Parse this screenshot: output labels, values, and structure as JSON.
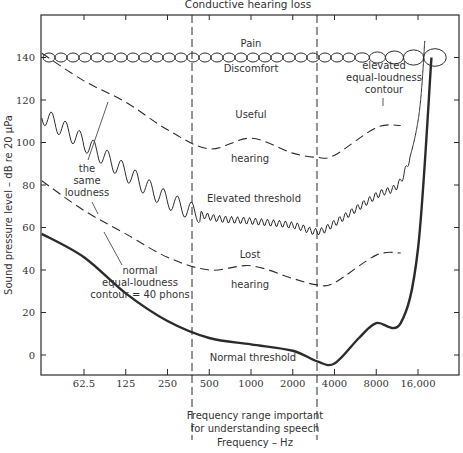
{
  "chart_data": {
    "type": "line",
    "title": "Conductive hearing loss",
    "xlabel": "Frequency – Hz",
    "ylabel": "Sound pressure level – dB re 20 μPa",
    "x_scale": "log",
    "x_ticks": [
      "62.5",
      "125",
      "250",
      "500",
      "1000",
      "2000",
      "4000",
      "8000",
      "16,000"
    ],
    "x_tick_values": [
      62.5,
      125,
      250,
      500,
      1000,
      2000,
      4000,
      8000,
      16000
    ],
    "y_ticks": [
      0,
      20,
      40,
      60,
      80,
      100,
      120,
      140
    ],
    "ylim": [
      -10,
      160
    ],
    "grid": false,
    "speech_range": {
      "x_start": 350,
      "x_end": 3000,
      "label_lines": [
        "Frequency range important",
        "for understanding speech"
      ]
    },
    "series": [
      {
        "name": "Normal threshold",
        "style": "solid-thick",
        "x": [
          31,
          62.5,
          125,
          250,
          500,
          1000,
          2000,
          3000,
          4000,
          6000,
          8000,
          12000,
          16000,
          20000
        ],
        "y": [
          57,
          46,
          29,
          16,
          8,
          5,
          2,
          -3,
          -4,
          8,
          15,
          15,
          50,
          140
        ]
      },
      {
        "name": "Elevated threshold",
        "style": "zigzag",
        "x": [
          31,
          62.5,
          125,
          250,
          500,
          1000,
          2000,
          3000,
          4000,
          8000,
          12000,
          16000,
          18000
        ],
        "y": [
          113,
          100,
          86,
          73,
          65,
          63,
          61,
          58,
          62,
          75,
          82,
          110,
          150
        ]
      },
      {
        "name": "normal equal-loudness contour = 40 phons",
        "style": "dashed",
        "x": [
          31,
          62.5,
          125,
          250,
          500,
          1000,
          2000,
          3000,
          4000,
          8000,
          12000
        ],
        "y": [
          82,
          68,
          57,
          46,
          40,
          42,
          36,
          33,
          34,
          47,
          48
        ]
      },
      {
        "name": "elevated equal-loudness contour",
        "style": "dashed",
        "x": [
          31,
          62.5,
          125,
          250,
          500,
          1000,
          2000,
          3000,
          4000,
          8000,
          12000
        ],
        "y": [
          142,
          129,
          119,
          106,
          97,
          102,
          95,
          93,
          94,
          107,
          108
        ]
      },
      {
        "name": "Pain / Discomfort",
        "style": "chain-ovals",
        "x": [
          31,
          16000,
          18000
        ],
        "y": [
          140,
          140,
          140
        ]
      }
    ],
    "annotations": [
      {
        "text": "Pain",
        "x": 1000,
        "y": 147
      },
      {
        "text": "Discomfort",
        "x": 1000,
        "y": 133
      },
      {
        "text": "Useful",
        "x": 1000,
        "y": 115
      },
      {
        "text": "hearing",
        "x": 1000,
        "y": 90
      },
      {
        "text": "Elevated threshold",
        "x": 1400,
        "y": 72
      },
      {
        "text": "Lost",
        "x": 1000,
        "y": 47
      },
      {
        "text": "hearing",
        "x": 1000,
        "y": 33
      },
      {
        "text": "Normal threshold",
        "x": 1200,
        "y": -1
      },
      {
        "text": "the same loudness",
        "x": 100,
        "y": 92
      },
      {
        "text": "normal equal-loudness contour = 40 phons",
        "x": 150,
        "y": 40
      },
      {
        "text": "elevated equal-loudness contour",
        "x": 9000,
        "y": 122
      }
    ]
  },
  "labels": {
    "title": "Conductive hearing loss",
    "ylabel": "Sound pressure level – dB re 20 μPa",
    "xlabel": "Frequency – Hz",
    "speech_line1": "Frequency range important",
    "speech_line2": "for understanding speech",
    "pain": "Pain",
    "discomfort": "Discomfort",
    "useful": "Useful",
    "hearing_upper": "hearing",
    "elevated_threshold": "Elevated threshold",
    "lost": "Lost",
    "hearing_lower": "hearing",
    "normal_threshold": "Normal threshold",
    "same_1": "the",
    "same_2": "same",
    "same_3": "loudness",
    "normal_el_1": "normal",
    "normal_el_2": "equal-loudness",
    "normal_el_3": "contour = 40 phons",
    "elev_el_1": "elevated",
    "elev_el_2": "equal-loudness",
    "elev_el_3": "contour"
  },
  "colors": {
    "ink": "#2b2b2b",
    "background": "#ffffff"
  }
}
